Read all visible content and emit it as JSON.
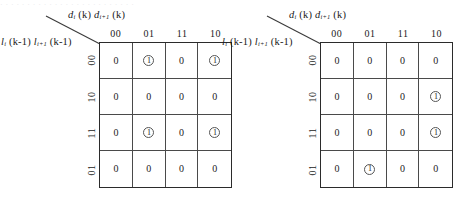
{
  "figure": {
    "type": "karnaugh-map-pair",
    "top_bleed_text": "· · ·  · ·   · · · · · ·  · · ·   · · · · ·  · ·  · · · ·"
  },
  "kmaps": [
    {
      "id": "kmap-left",
      "col_caption": {
        "terms": [
          {
            "symbol": "d",
            "subscript": "i",
            "arg": "(k)"
          },
          {
            "symbol": "d",
            "subscript": "i+1",
            "arg": "(k)"
          }
        ]
      },
      "row_caption": {
        "terms": [
          {
            "symbol": "l",
            "subscript": "i",
            "arg": "(k-1)"
          },
          {
            "symbol": "l",
            "subscript": "i+1",
            "arg": "(k-1)"
          }
        ]
      },
      "col_headers": [
        "00",
        "01",
        "11",
        "10"
      ],
      "row_headers": [
        "00",
        "10",
        "11",
        "01"
      ],
      "cells": [
        [
          "0",
          "1",
          "0",
          "1"
        ],
        [
          "0",
          "0",
          "0",
          "0"
        ],
        [
          "0",
          "1",
          "0",
          "1"
        ],
        [
          "0",
          "0",
          "0",
          "0"
        ]
      ],
      "circled": [
        [
          false,
          true,
          false,
          true
        ],
        [
          false,
          false,
          false,
          false
        ],
        [
          false,
          true,
          false,
          true
        ],
        [
          false,
          false,
          false,
          false
        ]
      ]
    },
    {
      "id": "kmap-right",
      "col_caption": {
        "terms": [
          {
            "symbol": "d",
            "subscript": "i",
            "arg": "(k)"
          },
          {
            "symbol": "d",
            "subscript": "i+1",
            "arg": "(k)"
          }
        ]
      },
      "row_caption": {
        "terms": [
          {
            "symbol": "l",
            "subscript": "i",
            "arg": "(k-1)"
          },
          {
            "symbol": "l",
            "subscript": "i+1",
            "arg": "(k-1)"
          }
        ]
      },
      "col_headers": [
        "00",
        "01",
        "11",
        "10"
      ],
      "row_headers": [
        "00",
        "10",
        "11",
        "01"
      ],
      "cells": [
        [
          "0",
          "0",
          "0",
          "0"
        ],
        [
          "0",
          "0",
          "0",
          "1"
        ],
        [
          "0",
          "0",
          "0",
          "1"
        ],
        [
          "0",
          "1",
          "0",
          "0"
        ]
      ],
      "circled": [
        [
          false,
          false,
          false,
          false
        ],
        [
          false,
          false,
          false,
          true
        ],
        [
          false,
          false,
          false,
          true
        ],
        [
          false,
          true,
          false,
          false
        ]
      ]
    }
  ],
  "colors": {
    "ink": "#1a1a1a",
    "grid_outer": "#2b2b2b",
    "grid_inner": "#4a4a4a",
    "background": "#ffffff"
  }
}
